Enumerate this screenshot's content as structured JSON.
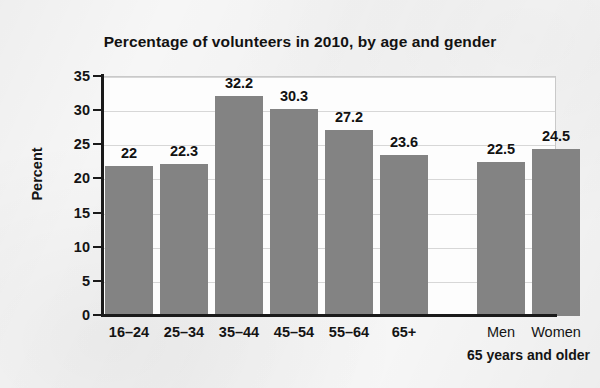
{
  "chart_data": {
    "type": "bar",
    "title": "Percentage of volunteers in 2010, by age and gender",
    "xlabel": "",
    "ylabel": "Percent",
    "ylim": [
      0,
      35
    ],
    "yticks": [
      0,
      5,
      10,
      15,
      20,
      25,
      30,
      35
    ],
    "ytick_labels": [
      "0",
      "5",
      "10",
      "15",
      "20",
      "25",
      "30",
      "35"
    ],
    "grid": true,
    "legend": "none",
    "categories": [
      "16–24",
      "25–34",
      "35–44",
      "45–54",
      "55–64",
      "65+",
      "Men",
      "Women"
    ],
    "values": [
      22,
      22.3,
      32.2,
      30.3,
      27.2,
      23.6,
      22.5,
      24.5
    ],
    "value_labels": [
      "22",
      "22.3",
      "32.2",
      "30.3",
      "27.2",
      "23.6",
      "22.5",
      "24.5"
    ],
    "groups": [
      {
        "name": "age",
        "categories": [
          "16–24",
          "25–34",
          "35–44",
          "45–54",
          "55–64",
          "65+"
        ],
        "caption": ""
      },
      {
        "name": "gender",
        "categories": [
          "Men",
          "Women"
        ],
        "caption": "65 years and older"
      }
    ],
    "annotations": [
      "65 years and older"
    ],
    "colors": {
      "bar": "#838383",
      "axis": "#1a1a1a",
      "grid": "#d7d7d7",
      "text": "#141414",
      "plot_background": "#fdfdfd",
      "figure_background": "#f6f6f6"
    }
  }
}
